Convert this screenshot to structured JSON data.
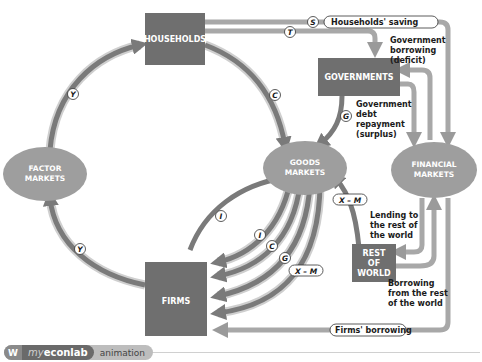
{
  "colors": {
    "box": "#6f6f6f",
    "ellipse": "#9e9e9e",
    "flow_dark": "#7a7a7a",
    "flow_light": "#b8b8b8",
    "background": "#ffffff"
  },
  "nodes": {
    "households": "HOUSEHOLDS",
    "governments": "GOVERNMENTS",
    "firms": "FIRMS",
    "rest_of_world": [
      "REST",
      "OF",
      "WORLD"
    ],
    "factor_markets": [
      "FACTOR",
      "MARKETS"
    ],
    "goods_markets": [
      "GOODS",
      "MARKETS"
    ],
    "financial_markets": [
      "FINANCIAL",
      "MARKETS"
    ]
  },
  "flow_tags": {
    "saving": "S",
    "taxes": "T",
    "consumption": "C",
    "government": "G",
    "income_top": "Y",
    "income_bottom": "Y",
    "investment_outer": "I",
    "investment_inner": "I",
    "consumption_firms": "C",
    "government_firms": "G",
    "net_exports_firms": "X – M",
    "net_exports_goods": "X – M"
  },
  "annotations": {
    "households_saving": "Households' saving",
    "gov_borrowing": [
      "Government",
      "borrowing",
      "(deficit)"
    ],
    "gov_repayment": [
      "Government",
      "debt",
      "repayment",
      "(surplus)"
    ],
    "lending_row": [
      "Lending to",
      "the rest of",
      "the world"
    ],
    "borrowing_row": [
      "Borrowing",
      "from the rest",
      "of the world"
    ],
    "firms_borrowing": "Firms' borrowing"
  },
  "footer": {
    "icon": "W",
    "brand_my": "my",
    "brand_name": "econlab",
    "label": "animation"
  }
}
